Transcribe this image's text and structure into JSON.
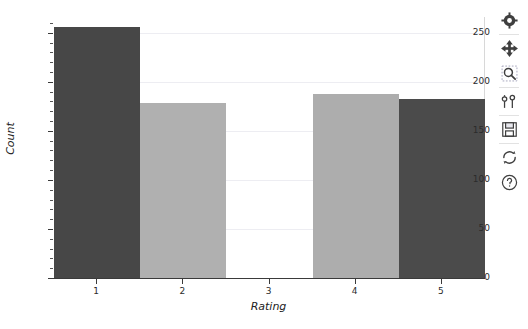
{
  "chart_data": {
    "type": "bar",
    "title": "",
    "xlabel": "Rating",
    "ylabel": "Count",
    "categories": [
      "1",
      "2",
      "3",
      "4",
      "5"
    ],
    "values": [
      256,
      178,
      0,
      188,
      182
    ],
    "colors": [
      "#474747",
      "#b0b0b0",
      "#ffffff",
      "#adadad",
      "#4b4b4b"
    ],
    "ylim": [
      0,
      266
    ],
    "yticks": [
      0,
      50,
      100,
      150,
      200,
      250
    ],
    "ytick_labels": [
      "0",
      "50",
      "100",
      "150",
      "200",
      "250"
    ],
    "xticks": [
      1,
      2,
      3,
      4,
      5
    ],
    "xtick_labels": [
      "1",
      "2",
      "3",
      "4",
      "5"
    ],
    "grid": true,
    "legend": null
  },
  "axis": {
    "y_labels": [
      "250",
      "200",
      "150",
      "100",
      "50",
      "0"
    ],
    "x_labels": [
      "1",
      "2",
      "3",
      "4",
      "5"
    ],
    "y_title": "Count",
    "x_title": "Rating"
  },
  "toolbar": {
    "items": [
      {
        "name": "configure-subplots-gear-icon",
        "label": "Configure"
      },
      {
        "name": "pan-icon",
        "label": "Pan"
      },
      {
        "name": "zoom-rect-icon",
        "label": "Zoom to rectangle"
      },
      {
        "name": "subplot-sliders-icon",
        "label": "Subplots"
      },
      {
        "name": "save-floppy-icon",
        "label": "Save figure"
      },
      {
        "name": "reset-refresh-icon",
        "label": "Reset view"
      },
      {
        "name": "help-question-icon",
        "label": "Help"
      }
    ]
  }
}
